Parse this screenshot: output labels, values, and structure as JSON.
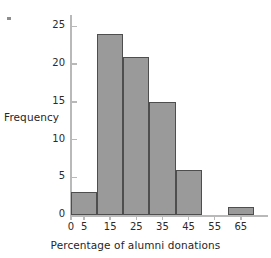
{
  "chart_data": {
    "type": "bar",
    "title": "",
    "subtitle": "",
    "xlabel": "Percentage of alumni donations",
    "ylabel": "Frequency",
    "bin_width": 10,
    "categories": [
      "0-10",
      "10-20",
      "20-30",
      "30-40",
      "40-50",
      "50-60",
      "60-70"
    ],
    "bin_edges": [
      0,
      10,
      20,
      30,
      40,
      50,
      60,
      70
    ],
    "values": [
      3,
      24,
      21,
      15,
      6,
      0,
      1
    ],
    "xlim": [
      0,
      75
    ],
    "ylim": [
      0,
      26.5
    ],
    "x_ticks": [
      0,
      5,
      15,
      25,
      35,
      45,
      55,
      65
    ],
    "x_tick_labels": [
      "0",
      "5",
      "15",
      "25",
      "35",
      "45",
      "55",
      "65"
    ],
    "y_ticks": [
      0,
      5,
      10,
      15,
      20,
      25
    ],
    "y_tick_labels": [
      "0",
      "5",
      "10",
      "15",
      "20",
      "25"
    ],
    "grid": false,
    "legend": null,
    "legend_position": "none",
    "annotations": [],
    "colors": {
      "bar_fill": "#9a9a9a",
      "bar_edge": "#4e4e4e",
      "axis": "#b9b9b9",
      "text": "#2b2b2b",
      "background": "#ffffff"
    }
  },
  "marks": {
    "corner_artifact": "tick-mark-artifact"
  }
}
